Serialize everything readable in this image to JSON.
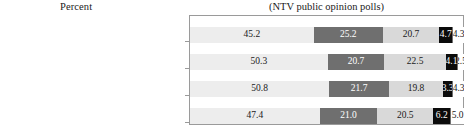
{
  "header": {
    "axis_caption": "Percent",
    "title": "(NTV public opinion polls)"
  },
  "colors": {
    "segment_1": "#ededed",
    "segment_2": "#6f6f6f",
    "segment_3": "#d9d9d9",
    "segment_4": "#0b0b0b",
    "segment_5": "#ffffff",
    "frame": "#9a9a9a",
    "text": "#1a1a1a"
  },
  "chart_data": {
    "type": "bar",
    "orientation": "horizontal",
    "stacked": true,
    "normalized_percent": true,
    "title": "(NTV public opinion polls)",
    "xlabel": "Percent",
    "ylabel": "",
    "xlim": [
      0,
      100
    ],
    "grid": false,
    "legend": "none",
    "categories": [
      "Nov 2011",
      "Nov 2012",
      "Feb 2013",
      "Mar 2013"
    ],
    "series": [
      {
        "name": "Segment 1",
        "values": [
          45.2,
          50.3,
          50.8,
          47.4
        ]
      },
      {
        "name": "Segment 2",
        "values": [
          25.2,
          20.7,
          21.7,
          21.0
        ]
      },
      {
        "name": "Segment 3",
        "values": [
          20.7,
          22.5,
          19.8,
          20.5
        ]
      },
      {
        "name": "Segment 4",
        "values": [
          4.7,
          4.1,
          3.3,
          6.2
        ]
      },
      {
        "name": "Segment 5",
        "values": [
          4.3,
          2.5,
          4.3,
          5.0
        ]
      }
    ],
    "rows": [
      {
        "label": "Nov 2011",
        "cells": [
          {
            "value": 45.2,
            "text": "45.2",
            "style": "s1"
          },
          {
            "value": 25.2,
            "text": "25.2",
            "style": "s2"
          },
          {
            "value": 20.7,
            "text": "20.7",
            "style": "s3"
          },
          {
            "value": 4.7,
            "text": "4.7",
            "style": "s4"
          },
          {
            "value": 4.3,
            "text": "4.3",
            "style": "s5"
          }
        ]
      },
      {
        "label": "Nov 2012",
        "cells": [
          {
            "value": 50.3,
            "text": "50.3",
            "style": "s1"
          },
          {
            "value": 20.7,
            "text": "20.7",
            "style": "s2"
          },
          {
            "value": 22.5,
            "text": "22.5",
            "style": "s3"
          },
          {
            "value": 4.1,
            "text": "4.1",
            "style": "s4"
          },
          {
            "value": 2.5,
            "text": "2.5",
            "style": "s5"
          }
        ]
      },
      {
        "label": "Feb 2013",
        "cells": [
          {
            "value": 50.8,
            "text": "50.8",
            "style": "s1"
          },
          {
            "value": 21.7,
            "text": "21.7",
            "style": "s2"
          },
          {
            "value": 19.8,
            "text": "19.8",
            "style": "s3"
          },
          {
            "value": 3.3,
            "text": "3.3",
            "style": "s4"
          },
          {
            "value": 4.3,
            "text": "4.3",
            "style": "s5"
          }
        ]
      },
      {
        "label": "Mar 2013",
        "cells": [
          {
            "value": 47.4,
            "text": "47.4",
            "style": "s1"
          },
          {
            "value": 21.0,
            "text": "21.0",
            "style": "s2"
          },
          {
            "value": 20.5,
            "text": "20.5",
            "style": "s3"
          },
          {
            "value": 6.2,
            "text": "6.2",
            "style": "s4"
          },
          {
            "value": 5.0,
            "text": "5.0",
            "style": "s5"
          }
        ]
      }
    ]
  },
  "layout": {
    "row_tops": [
      27,
      54,
      81,
      108
    ],
    "tick_tops": [
      41,
      68,
      95,
      122
    ]
  }
}
